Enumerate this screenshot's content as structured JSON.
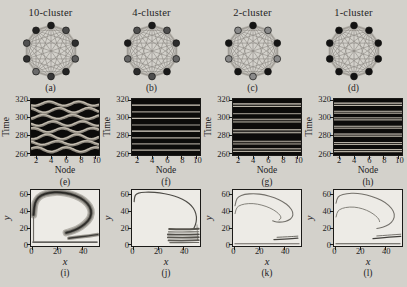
{
  "figure": {
    "colors": {
      "paper": "#d3d1cb",
      "raster_bg": "#0c0b0a",
      "plot_bg": "#edebe6",
      "ink": "#24231f",
      "edge": "#86837c",
      "ring": "#b4b1aa"
    }
  },
  "columns": [
    {
      "title": "10-cluster",
      "labels": {
        "network": "(a)",
        "raster": "(e)",
        "attractor": "(i)"
      }
    },
    {
      "title": "4-cluster",
      "labels": {
        "network": "(b)",
        "raster": "(f)",
        "attractor": "(j)"
      }
    },
    {
      "title": "2-cluster",
      "labels": {
        "network": "(c)",
        "raster": "(g)",
        "attractor": "(k)"
      }
    },
    {
      "title": "1-cluster",
      "labels": {
        "network": "(d)",
        "raster": "(h)",
        "attractor": "(l)"
      }
    }
  ],
  "axes": {
    "raster": {
      "xlabel": "Node",
      "ylabel": "Time",
      "xticks": [
        2,
        4,
        6,
        8,
        10
      ],
      "yticks": [
        260,
        280,
        300,
        320
      ],
      "xlim": [
        1.2,
        10.45
      ],
      "ylim": [
        258,
        321.5
      ]
    },
    "attractor": {
      "xlabel": "x",
      "ylabel": "y",
      "xticks": [
        0,
        20,
        40
      ],
      "yticks": [
        0,
        20,
        40,
        60
      ],
      "xlim": [
        -1,
        53
      ],
      "ylim": [
        -1.5,
        66
      ]
    }
  },
  "chart_data": [
    {
      "panel": "a",
      "type": "network",
      "title": "10-cluster",
      "nodes": 10,
      "coupling": "all-to-all",
      "node_colors": [
        "#1c1c1c",
        "#4a4a4a",
        "#2e2e2e",
        "#5c5c5c",
        "#242424",
        "#3a3a3a",
        "#6a6a6a",
        "#303030",
        "#515151",
        "#222222"
      ]
    },
    {
      "panel": "b",
      "type": "network",
      "title": "4-cluster",
      "nodes": 10,
      "coupling": "all-to-all",
      "node_colors": [
        "#1a1a1a",
        "#4f4f4f",
        "#2c2c2c",
        "#666666",
        "#1a1a1a",
        "#4f4f4f",
        "#2c2c2c",
        "#666666",
        "#1a1a1a",
        "#4f4f4f"
      ]
    },
    {
      "panel": "c",
      "type": "network",
      "title": "2-cluster",
      "nodes": 10,
      "coupling": "all-to-all",
      "node_colors": [
        "#141414",
        "#8a8a8a",
        "#141414",
        "#8a8a8a",
        "#141414",
        "#8a8a8a",
        "#141414",
        "#8a8a8a",
        "#141414",
        "#8a8a8a"
      ]
    },
    {
      "panel": "d",
      "type": "network",
      "title": "1-cluster",
      "nodes": 10,
      "coupling": "all-to-all",
      "node_colors": [
        "#121212",
        "#121212",
        "#121212",
        "#121212",
        "#121212",
        "#121212",
        "#121212",
        "#121212",
        "#121212",
        "#121212"
      ]
    },
    {
      "panel": "e",
      "type": "heatmap",
      "pattern": "wavy",
      "xlabel": "Node",
      "ylabel": "Time",
      "xlim": [
        1,
        10
      ],
      "ylim": [
        260,
        320
      ],
      "bands": [
        {
          "t": 264,
          "amp": 2.6,
          "phase": 0.4
        },
        {
          "t": 271.5,
          "amp": 2.2,
          "phase": 2.3
        },
        {
          "t": 278.5,
          "amp": 2.8,
          "phase": 4.4
        },
        {
          "t": 286,
          "amp": 2.4,
          "phase": 1.1
        },
        {
          "t": 293.5,
          "amp": 2.6,
          "phase": 3.2
        },
        {
          "t": 301,
          "amp": 2.3,
          "phase": 5.3
        },
        {
          "t": 308.5,
          "amp": 2.7,
          "phase": 1.9
        },
        {
          "t": 316,
          "amp": 2.4,
          "phase": 4.0
        }
      ]
    },
    {
      "panel": "f",
      "type": "heatmap",
      "pattern": "stripes",
      "xlabel": "Node",
      "ylabel": "Time",
      "xlim": [
        1,
        10
      ],
      "ylim": [
        260,
        320
      ],
      "stripes": [
        [
          263.5,
          1,
          0.85
        ],
        [
          270.5,
          1,
          0.7
        ],
        [
          277.5,
          1,
          0.8
        ],
        [
          285,
          1.6,
          1
        ],
        [
          292,
          1,
          0.75
        ],
        [
          299.5,
          1,
          0.85
        ],
        [
          307,
          1,
          0.7
        ],
        [
          314.5,
          1.6,
          0.95
        ]
      ]
    },
    {
      "panel": "g",
      "type": "heatmap",
      "pattern": "stripes",
      "xlabel": "Node",
      "ylabel": "Time",
      "xlim": [
        1,
        10
      ],
      "ylim": [
        260,
        320
      ],
      "stripes": [
        [
          263.5,
          3,
          0.9
        ],
        [
          272,
          3,
          0.85
        ],
        [
          285,
          3.4,
          1
        ],
        [
          297,
          3.2,
          0.9
        ],
        [
          305,
          1,
          0.6
        ],
        [
          314.5,
          3,
          0.95
        ]
      ]
    },
    {
      "panel": "h",
      "type": "heatmap",
      "pattern": "stripes",
      "xlabel": "Node",
      "ylabel": "Time",
      "xlim": [
        1,
        10
      ],
      "ylim": [
        260,
        320
      ],
      "stripes": [
        [
          263,
          2.4,
          0.9
        ],
        [
          271,
          2.4,
          0.85
        ],
        [
          280.5,
          2.6,
          1
        ],
        [
          289.5,
          2.4,
          0.9
        ],
        [
          299,
          2.4,
          0.8
        ],
        [
          306.5,
          2.4,
          0.9
        ],
        [
          315.5,
          2.6,
          0.95
        ]
      ]
    },
    {
      "panel": "i",
      "type": "line",
      "xlabel": "x",
      "ylabel": "y",
      "xlim": [
        0,
        52
      ],
      "ylim": [
        0,
        66
      ],
      "series": [
        {
          "name": "attractor-band",
          "layers": [
            [
              7.5,
              "#b5b2ab"
            ],
            [
              5,
              "#8e8b84"
            ],
            [
              2.6,
              "#45433f"
            ],
            [
              1,
              "#23221f"
            ]
          ],
          "points": [
            [
              1,
              36
            ],
            [
              1.5,
              46
            ],
            [
              3,
              54
            ],
            [
              7,
              60
            ],
            [
              14,
              63
            ],
            [
              22,
              63.5
            ],
            [
              30,
              61.5
            ],
            [
              38,
              57
            ],
            [
              44,
              50
            ],
            [
              47,
              42
            ],
            [
              46.5,
              33
            ],
            [
              42,
              25
            ],
            [
              36,
              19
            ],
            [
              30,
              15.5
            ],
            [
              27,
              14.5
            ]
          ]
        },
        {
          "name": "lower-band",
          "layers": [
            [
              3.6,
              "#9a968e"
            ],
            [
              1.4,
              "#3c3a36"
            ]
          ],
          "points": [
            [
              29,
              7.8
            ],
            [
              36,
              9
            ],
            [
              45,
              10.8
            ],
            [
              52,
              12.3
            ]
          ]
        },
        {
          "name": "baseline",
          "layers": [
            [
              1.5,
              "#35332f"
            ]
          ],
          "points": [
            [
              0.5,
              3.2
            ],
            [
              51.5,
              3.2
            ]
          ]
        },
        {
          "name": "left-edge",
          "layers": [
            [
              1.2,
              "#6e6b65"
            ]
          ],
          "points": [
            [
              1,
              4
            ],
            [
              1,
              33
            ]
          ]
        }
      ]
    },
    {
      "panel": "j",
      "type": "line",
      "xlabel": "x",
      "ylabel": "y",
      "xlim": [
        0,
        52
      ],
      "ylim": [
        0,
        66
      ],
      "series": [
        {
          "name": "spiral-curve",
          "layers": [
            [
              1.2,
              "#4e4c47"
            ]
          ],
          "points": [
            [
              0.7,
              52
            ],
            [
              1,
              58
            ],
            [
              2.5,
              61.5
            ],
            [
              6,
              63
            ],
            [
              13,
              63.6
            ],
            [
              21,
              62.5
            ],
            [
              29,
              60.5
            ],
            [
              36,
              57
            ],
            [
              42,
              52.5
            ],
            [
              46.5,
              47
            ],
            [
              49,
              41
            ],
            [
              50.3,
              34
            ],
            [
              50,
              27
            ],
            [
              48.8,
              22
            ],
            [
              48,
              19.5
            ]
          ]
        },
        {
          "name": "right-drop",
          "layers": [
            [
              0.9,
              "#8d8a83"
            ]
          ],
          "points": [
            [
              50.6,
              24
            ],
            [
              51,
              14
            ],
            [
              51,
              5
            ]
          ]
        },
        {
          "name": "bundle-line",
          "layers": [
            [
              2.0,
              "#57544e"
            ]
          ],
          "points": [
            [
              28.5,
              19
            ],
            [
              36,
              18.6
            ],
            [
              45,
              18.8
            ],
            [
              52,
              19.2
            ]
          ]
        },
        {
          "name": "bundle-line",
          "layers": [
            [
              1.2,
              "#6e6b64"
            ]
          ],
          "points": [
            [
              28,
              15.6
            ],
            [
              38,
              15.2
            ],
            [
              52,
              15.7
            ]
          ]
        },
        {
          "name": "bundle-line",
          "layers": [
            [
              1.9,
              "#514e49"
            ]
          ],
          "points": [
            [
              27.5,
              12.4
            ],
            [
              38,
              12.0
            ],
            [
              52,
              12.5
            ]
          ]
        },
        {
          "name": "bundle-line",
          "layers": [
            [
              1.9,
              "#57544e"
            ]
          ],
          "points": [
            [
              27.5,
              8.8
            ],
            [
              40,
              8.5
            ],
            [
              52,
              9.0
            ]
          ]
        },
        {
          "name": "bundle-line",
          "layers": [
            [
              1.8,
              "#5b5852"
            ]
          ],
          "points": [
            [
              28,
              5.2
            ],
            [
              41,
              5.0
            ],
            [
              52,
              5.5
            ]
          ]
        },
        {
          "name": "bundle-line",
          "layers": [
            [
              1.1,
              "#6e6b64"
            ]
          ],
          "points": [
            [
              29,
              2.6
            ],
            [
              43,
              2.5
            ],
            [
              52,
              2.8
            ]
          ]
        }
      ]
    },
    {
      "panel": "k",
      "type": "line",
      "xlabel": "x",
      "ylabel": "y",
      "xlim": [
        0,
        52
      ],
      "ylim": [
        0,
        66
      ],
      "series": [
        {
          "name": "outer-loop",
          "layers": [
            [
              1.1,
              "#73706a"
            ]
          ],
          "points": [
            [
              0.6,
              47
            ],
            [
              1.3,
              53.5
            ],
            [
              3.2,
              58
            ],
            [
              8,
              60.8
            ],
            [
              16,
              61.8
            ],
            [
              24,
              60.3
            ],
            [
              32,
              56.8
            ],
            [
              39,
              51.8
            ],
            [
              44,
              45.8
            ],
            [
              46.8,
              39
            ],
            [
              46.3,
              33
            ],
            [
              43,
              29
            ],
            [
              38,
              27.2
            ],
            [
              33.5,
              27.3
            ],
            [
              30.5,
              28.8
            ]
          ]
        },
        {
          "name": "inner-loop",
          "layers": [
            [
              1.0,
              "#807d76"
            ]
          ],
          "points": [
            [
              0.6,
              37.5
            ],
            [
              1.3,
              43
            ],
            [
              3.2,
              46.8
            ],
            [
              8,
              49.3
            ],
            [
              15,
              49.9
            ],
            [
              22,
              47.9
            ],
            [
              28.5,
              44.4
            ],
            [
              33.5,
              39.9
            ],
            [
              36.6,
              35.4
            ],
            [
              37.3,
              31.9
            ],
            [
              35.6,
              29.9
            ]
          ]
        },
        {
          "name": "lower-line",
          "layers": [
            [
              1.25,
              "#45433f"
            ]
          ],
          "points": [
            [
              31.5,
              6.3
            ],
            [
              41,
              7.0
            ],
            [
              50.5,
              7.9
            ]
          ]
        },
        {
          "name": "lower-line",
          "layers": [
            [
              0.9,
              "#5b5852"
            ]
          ],
          "points": [
            [
              34,
              9.0
            ],
            [
              44,
              9.7
            ],
            [
              50.5,
              10.4
            ]
          ]
        },
        {
          "name": "baseline",
          "layers": [
            [
              0.9,
              "#57544e"
            ]
          ],
          "points": [
            [
              0.5,
              1.2
            ],
            [
              51.5,
              1.2
            ]
          ]
        }
      ]
    },
    {
      "panel": "l",
      "type": "line",
      "xlabel": "x",
      "ylabel": "y",
      "xlim": [
        0,
        52
      ],
      "ylim": [
        0,
        66
      ],
      "series": [
        {
          "name": "outer-loop",
          "layers": [
            [
              1.1,
              "#73706a"
            ]
          ],
          "points": [
            [
              0.6,
              50
            ],
            [
              1.3,
              55.5
            ],
            [
              3.2,
              59.3
            ],
            [
              9,
              61.8
            ],
            [
              17,
              62.3
            ],
            [
              25,
              60.3
            ],
            [
              33,
              56.3
            ],
            [
              40,
              50.8
            ],
            [
              44.8,
              44
            ],
            [
              47.3,
              37
            ],
            [
              46.3,
              29.8
            ],
            [
              42.8,
              24.3
            ],
            [
              37.5,
              20.8
            ],
            [
              33,
              19.6
            ]
          ]
        },
        {
          "name": "inner-loop",
          "layers": [
            [
              1.0,
              "#807d76"
            ]
          ],
          "points": [
            [
              0.6,
              33.5
            ],
            [
              1.3,
              38.8
            ],
            [
              3.2,
              42.5
            ],
            [
              8,
              45.1
            ],
            [
              15,
              45.7
            ],
            [
              22,
              43.4
            ],
            [
              27.8,
              39.6
            ],
            [
              32.2,
              34.9
            ],
            [
              34.7,
              30.9
            ],
            [
              35.2,
              27.9
            ]
          ]
        },
        {
          "name": "lower-line",
          "layers": [
            [
              1.35,
              "#413f3b"
            ]
          ],
          "points": [
            [
              30,
              7.3
            ],
            [
              40,
              8.7
            ],
            [
              52,
              10.2
            ]
          ]
        },
        {
          "name": "lower-line",
          "layers": [
            [
              0.9,
              "#66635d"
            ]
          ],
          "points": [
            [
              33,
              10.6
            ],
            [
              43,
              11.7
            ],
            [
              52,
              12.7
            ]
          ]
        },
        {
          "name": "baseline",
          "layers": [
            [
              1.0,
              "#524f4a"
            ]
          ],
          "points": [
            [
              0.5,
              1.2
            ],
            [
              51.5,
              1.2
            ]
          ]
        }
      ]
    }
  ]
}
